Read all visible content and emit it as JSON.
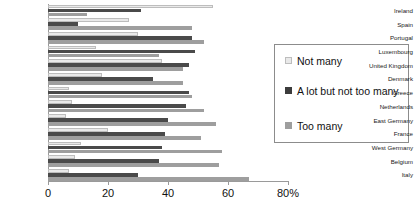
{
  "chart_data": {
    "type": "bar",
    "orientation": "horizontal",
    "title": "",
    "xlabel": "",
    "ylabel": "",
    "xlim": [
      0,
      80
    ],
    "xticks": [
      0,
      20,
      40,
      60,
      80
    ],
    "xtick_labels": [
      "0",
      "20",
      "40",
      "60",
      "80%"
    ],
    "grid": false,
    "legend_position": "right",
    "categories": [
      "Ireland",
      "Spain",
      "Portugal",
      "Luxembourg",
      "United Kingdom",
      "Denmark",
      "Greece",
      "Netherlands",
      "East Germany",
      "France",
      "West Germany",
      "Belgium",
      "Italy"
    ],
    "series": [
      {
        "name": "Not many",
        "color": "#e9e9e9",
        "values": [
          55,
          27,
          30,
          16,
          38,
          18,
          7,
          8,
          6,
          20,
          11,
          9,
          7
        ]
      },
      {
        "name": "A lot but not too many",
        "color": "#4a4a4a",
        "values": [
          31,
          10,
          48,
          49,
          47,
          35,
          47,
          46,
          40,
          39,
          38,
          37,
          30
        ]
      },
      {
        "name": "Too many",
        "color": "#9e9e9e",
        "values": [
          13,
          48,
          52,
          37,
          45,
          45,
          48,
          52,
          56,
          51,
          58,
          57,
          67
        ]
      }
    ]
  },
  "legend": {
    "items": [
      {
        "label": "Not many"
      },
      {
        "label": "A lot but not too many"
      },
      {
        "label": "Too many"
      }
    ]
  }
}
